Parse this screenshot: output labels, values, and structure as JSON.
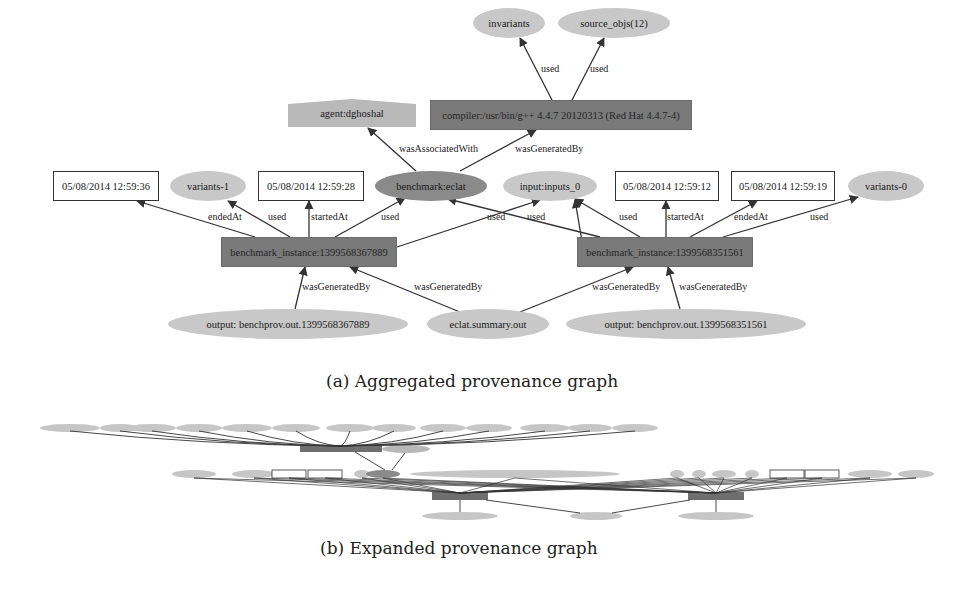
{
  "figure_a": {
    "caption": "(a) Aggregated provenance graph",
    "nodes": [
      {
        "id": "invariants",
        "label": "invariants",
        "shape": "ellipse-light",
        "x": 473,
        "y": 8,
        "w": 72,
        "h": 30
      },
      {
        "id": "source_objs",
        "label": "source_objs(12)",
        "shape": "ellipse-light",
        "x": 558,
        "y": 8,
        "w": 112,
        "h": 30
      },
      {
        "id": "agent",
        "label": "agent:dghoshal",
        "shape": "agent",
        "x": 288,
        "y": 99,
        "w": 128,
        "h": 28
      },
      {
        "id": "compiler",
        "label": "compiler:/usr/bin/g++ 4.4.7 20120313 (Red Hat 4.4.7-4)",
        "shape": "rect-dark",
        "x": 430,
        "y": 100,
        "w": 262,
        "h": 30
      },
      {
        "id": "ts_3936",
        "label": "05/08/2014 12:59:36",
        "shape": "rect-box",
        "x": 53,
        "y": 171,
        "w": 106,
        "h": 30
      },
      {
        "id": "variants1",
        "label": "variants-1",
        "shape": "ellipse-light",
        "x": 170,
        "y": 171,
        "w": 76,
        "h": 30
      },
      {
        "id": "ts_3928",
        "label": "05/08/2014 12:59:28",
        "shape": "rect-box",
        "x": 258,
        "y": 171,
        "w": 106,
        "h": 30
      },
      {
        "id": "benchmark",
        "label": "benchmark:eclat",
        "shape": "ellipse-dark",
        "x": 375,
        "y": 171,
        "w": 112,
        "h": 30
      },
      {
        "id": "input0",
        "label": "input:inputs_0",
        "shape": "ellipse-light",
        "x": 503,
        "y": 171,
        "w": 94,
        "h": 30
      },
      {
        "id": "ts_3912",
        "label": "05/08/2014 12:59:12",
        "shape": "rect-box",
        "x": 615,
        "y": 171,
        "w": 104,
        "h": 30
      },
      {
        "id": "ts_3919",
        "label": "05/08/2014 12:59:19",
        "shape": "rect-box",
        "x": 731,
        "y": 171,
        "w": 104,
        "h": 30
      },
      {
        "id": "variants0",
        "label": "variants-0",
        "shape": "ellipse-light",
        "x": 848,
        "y": 171,
        "w": 76,
        "h": 30
      },
      {
        "id": "inst1",
        "label": "benchmark_instance:1399568367889",
        "shape": "rect-dark",
        "x": 221,
        "y": 237,
        "w": 176,
        "h": 30
      },
      {
        "id": "inst2",
        "label": "benchmark_instance:1399568351561",
        "shape": "rect-dark",
        "x": 577,
        "y": 237,
        "w": 176,
        "h": 30
      },
      {
        "id": "out1",
        "label": "output: benchprov.out.1399568367889",
        "shape": "ellipse-light",
        "x": 168,
        "y": 309,
        "w": 240,
        "h": 30
      },
      {
        "id": "eclatsum",
        "label": "eclat.summary.out",
        "shape": "ellipse-light",
        "x": 427,
        "y": 309,
        "w": 122,
        "h": 30
      },
      {
        "id": "out2",
        "label": "output: benchprov.out.1399568351561",
        "shape": "ellipse-light",
        "x": 566,
        "y": 309,
        "w": 240,
        "h": 30
      }
    ],
    "edges": [
      {
        "from": "compiler",
        "to": "invariants",
        "label": "used",
        "fx": 552,
        "fy": 100,
        "tx": 520,
        "ty": 38,
        "lx": 541,
        "ly": 63
      },
      {
        "from": "compiler",
        "to": "source_objs",
        "label": "used",
        "fx": 572,
        "fy": 100,
        "tx": 604,
        "ty": 38,
        "lx": 590,
        "ly": 63
      },
      {
        "from": "benchmark",
        "to": "agent",
        "label": "wasAssociatedWith",
        "fx": 416,
        "fy": 171,
        "tx": 368,
        "ty": 128,
        "lx": 399,
        "ly": 143
      },
      {
        "from": "benchmark",
        "to": "compiler",
        "label": "wasGeneratedBy",
        "fx": 460,
        "fy": 171,
        "tx": 536,
        "ty": 130,
        "lx": 515,
        "ly": 143
      },
      {
        "from": "inst1",
        "to": "ts_3936",
        "label": "endedAt",
        "fx": 255,
        "fy": 237,
        "tx": 137,
        "ty": 201,
        "lx": 208,
        "ly": 211
      },
      {
        "from": "inst1",
        "to": "variants1",
        "label": "used",
        "fx": 290,
        "fy": 237,
        "tx": 228,
        "ty": 201,
        "lx": 268,
        "ly": 211
      },
      {
        "from": "inst1",
        "to": "ts_3928",
        "label": "startedAt",
        "fx": 309,
        "fy": 237,
        "tx": 309,
        "ty": 201,
        "lx": 311,
        "ly": 211
      },
      {
        "from": "inst1",
        "to": "benchmark",
        "label": "used",
        "fx": 335,
        "fy": 237,
        "tx": 405,
        "ty": 198,
        "lx": 381,
        "ly": 211
      },
      {
        "from": "inst1",
        "to": "input0",
        "label": "used",
        "fx": 397,
        "fy": 247,
        "tx": 540,
        "ty": 200,
        "lx": 527,
        "ly": 211
      },
      {
        "from": "inst2",
        "to": "benchmark",
        "label": "used",
        "fx": 600,
        "fy": 237,
        "tx": 448,
        "ty": 199,
        "lx": 487,
        "ly": 211
      },
      {
        "from": "inst2",
        "to": "input0",
        "label": "used",
        "fx": 583,
        "fy": 247,
        "tx": 575,
        "ty": 200,
        "lx": 0,
        "ly": 0,
        "hidden_label": true
      },
      {
        "from": "inst2",
        "to": "ts_3912",
        "label": "used",
        "fx": 640,
        "fy": 237,
        "tx": 575,
        "ty": 199,
        "lx": 619,
        "ly": 211
      },
      {
        "from": "inst2",
        "to": "ts_3912b",
        "label": "startedAt",
        "fx": 666,
        "fy": 237,
        "tx": 666,
        "ty": 201,
        "lx": 667,
        "ly": 211
      },
      {
        "from": "inst2",
        "to": "ts_3919",
        "label": "endedAt",
        "fx": 690,
        "fy": 237,
        "tx": 757,
        "ty": 201,
        "lx": 734,
        "ly": 211
      },
      {
        "from": "inst2",
        "to": "variants0",
        "label": "used",
        "fx": 723,
        "fy": 237,
        "tx": 858,
        "ty": 197,
        "lx": 810,
        "ly": 211
      },
      {
        "from": "out1",
        "to": "inst1",
        "label": "wasGeneratedBy",
        "fx": 295,
        "fy": 309,
        "tx": 305,
        "ty": 267,
        "lx": 302,
        "ly": 281
      },
      {
        "from": "eclatsum",
        "to": "inst1",
        "label": "wasGeneratedBy",
        "fx": 460,
        "fy": 312,
        "tx": 350,
        "ty": 267,
        "lx": 414,
        "ly": 281
      },
      {
        "from": "eclatsum",
        "to": "inst2",
        "label": "wasGeneratedBy",
        "fx": 520,
        "fy": 312,
        "tx": 633,
        "ty": 267,
        "lx": 592,
        "ly": 281
      },
      {
        "from": "out2",
        "to": "inst2",
        "label": "wasGeneratedBy",
        "fx": 680,
        "fy": 309,
        "tx": 668,
        "ty": 267,
        "lx": 679,
        "ly": 281
      }
    ]
  },
  "figure_b": {
    "caption": "(b) Expanded provenance graph",
    "note": "Expanded graph labels are illegible at this resolution"
  }
}
